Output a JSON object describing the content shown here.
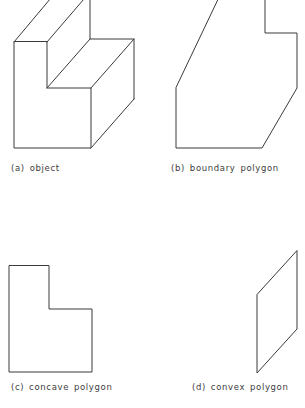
{
  "figure": {
    "background_color": "#ffffff",
    "line_color": "#3a3a3a",
    "text_color": "#3d3d3d",
    "panels": [
      {
        "id": "a",
        "caption": "(a) object",
        "shape_name": "isometric-notched-block",
        "description": "3D isometric drawing of a rectangular block with a step notch cut into the top"
      },
      {
        "id": "b",
        "caption": "(b) boundary polygon",
        "shape_name": "boundary-polygon",
        "description": "Silhouette outline of the object: a polygon with a rectangular notch at top right and a chamfered lower right corner"
      },
      {
        "id": "c",
        "caption": "(c) concave polygon",
        "shape_name": "concave-L-polygon",
        "description": "L shaped polygon with a reflex interior vertex"
      },
      {
        "id": "d",
        "caption": "(d) convex polygon",
        "shape_name": "convex-parallelogram",
        "description": "Slanted parallelogram, all interior angles convex"
      }
    ]
  },
  "geometry": {
    "object_paths": [
      "M14,42 L14,148 L91,148 L91,88 L47,88 L47,42 Z",
      "M14,42 L56,-8",
      "M47,42 L90,-8",
      "M47,88 L90,39",
      "M91,88 L134,39",
      "M91,148 L134,99",
      "M134,99 L134,39 L90,39 L90,-8",
      "M56,-8 L90,-8"
    ],
    "boundary_polygon_path": "M176,88 L176,148 L262,148 L297,88 L297,33 L265,33 L265,-8 L222,-8 Z",
    "concave_polygon_path": "M9,38 L9,144 L92,144 L92,81 L49,81 L49,38 Z",
    "convex_polygon_path": "M297,23 L297,101 L257,145 L257,67 Z"
  }
}
